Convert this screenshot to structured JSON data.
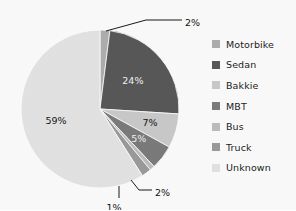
{
  "chart_data": {
    "type": "pie",
    "title": "",
    "xlabel": "",
    "ylabel": "",
    "legend_position": "right",
    "grid": false,
    "units": "percent",
    "categories": [
      "Motorbike",
      "Sedan",
      "Bakkie",
      "MBT",
      "Bus",
      "Truck",
      "Unknown"
    ],
    "values": [
      2,
      24,
      7,
      5,
      1,
      2,
      59
    ],
    "data_labels": [
      "2%",
      "24%",
      "7%",
      "5%",
      "1%",
      "2%",
      "59%"
    ],
    "colors": [
      "#aeaeae",
      "#585858",
      "#c9c9c9",
      "#7b7b7b",
      "#bdbdbd",
      "#9a9a9a",
      "#e3e3e3"
    ],
    "slices": [
      {
        "label": "Motorbike",
        "value": 2,
        "data_label": "2%",
        "color": "#aeaeae",
        "callout": true,
        "label_fill": "dark"
      },
      {
        "label": "Sedan",
        "value": 24,
        "data_label": "24%",
        "color": "#585858",
        "callout": false,
        "label_fill": "light"
      },
      {
        "label": "Bakkie",
        "value": 7,
        "data_label": "7%",
        "color": "#c9c9c9",
        "callout": false,
        "label_fill": "dark"
      },
      {
        "label": "MBT",
        "value": 5,
        "data_label": "5%",
        "color": "#7b7b7b",
        "callout": false,
        "label_fill": "light"
      },
      {
        "label": "Bus",
        "value": 1,
        "data_label": "1%",
        "color": "#bdbdbd",
        "callout": true,
        "label_fill": "dark"
      },
      {
        "label": "Truck",
        "value": 2,
        "data_label": "2%",
        "color": "#9a9a9a",
        "callout": true,
        "label_fill": "dark"
      },
      {
        "label": "Unknown",
        "value": 59,
        "data_label": "59%",
        "color": "#e3e3e3",
        "callout": false,
        "label_fill": "dark"
      }
    ]
  },
  "legend": {
    "items": [
      {
        "label": "Motorbike",
        "color": "#aeaeae"
      },
      {
        "label": "Sedan",
        "color": "#585858"
      },
      {
        "label": "Bakkie",
        "color": "#c9c9c9"
      },
      {
        "label": "MBT",
        "color": "#7b7b7b"
      },
      {
        "label": "Bus",
        "color": "#bdbdbd"
      },
      {
        "label": "Truck",
        "color": "#9a9a9a"
      },
      {
        "label": "Unknown",
        "color": "#e3e3e3"
      }
    ]
  },
  "labels": {
    "motorbike_callout": "2%",
    "sedan_inline": "24%",
    "bakkie_inline": "7%",
    "mbt_inline": "5%",
    "bus_callout": "1%",
    "truck_callout": "2%",
    "unknown_inline": "59%"
  }
}
